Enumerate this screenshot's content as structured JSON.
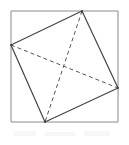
{
  "figure": {
    "canvas": {
      "width": 129,
      "height": 145,
      "background": "#ffffff"
    },
    "colors": {
      "outer_square_stroke": "#8a8a8a",
      "quadrilateral_stroke": "#444444",
      "diagonal_stroke": "#555555",
      "fill": "none"
    },
    "stroke_widths": {
      "outer_square": 1,
      "quadrilateral": 1.2,
      "diagonal": 1
    },
    "dash_pattern": "4,3",
    "outer_square": {
      "label": "outer-square",
      "x": 11,
      "y": 11,
      "width": 107,
      "height": 111,
      "points": "11,11 118,11 118,122 11,122"
    },
    "vertices": [
      {
        "name": "left-vertex",
        "x": 11,
        "y": 45,
        "on_edge": "left"
      },
      {
        "name": "top-vertex",
        "x": 82,
        "y": 11,
        "on_edge": "top"
      },
      {
        "name": "right-vertex",
        "x": 118,
        "y": 88,
        "on_edge": "right"
      },
      {
        "name": "bottom-vertex",
        "x": 45,
        "y": 122,
        "on_edge": "bottom"
      }
    ],
    "quadrilateral": {
      "label": "inscribed-quadrilateral",
      "points": "11,45 82,11 118,88 45,122"
    },
    "diagonals": [
      {
        "name": "diagonal-left-right",
        "x1": 11,
        "y1": 45,
        "x2": 118,
        "y2": 88,
        "style": "dashed"
      },
      {
        "name": "diagonal-top-bottom",
        "x1": 82,
        "y1": 11,
        "x2": 45,
        "y2": 122,
        "style": "dashed"
      }
    ],
    "intersection": {
      "name": "diagonal-intersection",
      "x": 64,
      "y": 70
    }
  }
}
